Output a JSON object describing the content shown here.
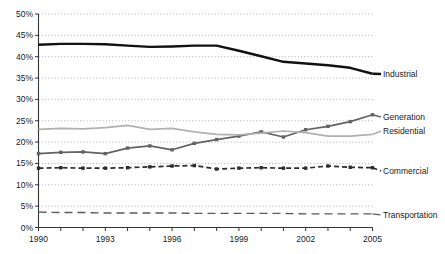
{
  "chart_data": {
    "type": "line",
    "title": "",
    "xlabel": "",
    "ylabel": "",
    "xlim": [
      1990,
      2005
    ],
    "ylim": [
      0,
      50
    ],
    "grid": true,
    "legend_position": "right-inline",
    "x": [
      1990,
      1991,
      1992,
      1993,
      1994,
      1995,
      1996,
      1997,
      1998,
      1999,
      2000,
      2001,
      2002,
      2003,
      2004,
      2005
    ],
    "xtick_labels": [
      "1990",
      "1993",
      "1996",
      "1999",
      "2002",
      "2005"
    ],
    "xtick_values": [
      1990,
      1993,
      1996,
      1999,
      2002,
      2005
    ],
    "ytick_labels": [
      "0%",
      "5%",
      "10%",
      "15%",
      "20%",
      "25%",
      "30%",
      "35%",
      "40%",
      "45%",
      "50%"
    ],
    "ytick_values": [
      0,
      5,
      10,
      15,
      20,
      25,
      30,
      35,
      40,
      45,
      50
    ],
    "series": [
      {
        "name": "Industrial",
        "label": "Industrial",
        "color": "#111111",
        "style": "solid-thick",
        "marker": "none",
        "values": [
          42.8,
          43.0,
          43.0,
          42.9,
          42.6,
          42.3,
          42.4,
          42.6,
          42.6,
          41.4,
          40.1,
          38.8,
          38.4,
          38.0,
          37.4,
          36.0
        ]
      },
      {
        "name": "Generation",
        "label": "Generation",
        "color": "#636363",
        "style": "solid",
        "marker": "square",
        "values": [
          17.3,
          17.6,
          17.7,
          17.3,
          18.6,
          19.1,
          18.2,
          19.7,
          20.6,
          21.4,
          22.4,
          21.2,
          22.9,
          23.7,
          24.8,
          26.4
        ]
      },
      {
        "name": "Residential",
        "label": "Residential",
        "color": "#b0b0b0",
        "style": "solid",
        "marker": "none",
        "values": [
          23.0,
          23.2,
          23.1,
          23.4,
          23.9,
          23.0,
          23.2,
          22.4,
          21.8,
          21.7,
          22.1,
          22.6,
          22.2,
          21.4,
          21.4,
          21.8
        ]
      },
      {
        "name": "Commercial",
        "label": "Commercial",
        "color": "#2b2b2b",
        "style": "dashed",
        "marker": "square",
        "values": [
          13.9,
          14.0,
          13.9,
          13.9,
          14.0,
          14.2,
          14.4,
          14.5,
          13.7,
          13.9,
          14.0,
          13.9,
          13.9,
          14.4,
          14.1,
          14.0
        ]
      },
      {
        "name": "Transportation",
        "label": "Transportation",
        "color": "#5a5a5a",
        "style": "long-dashed",
        "marker": "none",
        "values": [
          3.6,
          3.5,
          3.5,
          3.4,
          3.4,
          3.4,
          3.4,
          3.3,
          3.3,
          3.3,
          3.3,
          3.3,
          3.2,
          3.2,
          3.2,
          3.2
        ]
      }
    ]
  },
  "axes": {
    "axis_color": "#333333",
    "grid_color": "#9a9a9a",
    "background": "#ffffff"
  }
}
